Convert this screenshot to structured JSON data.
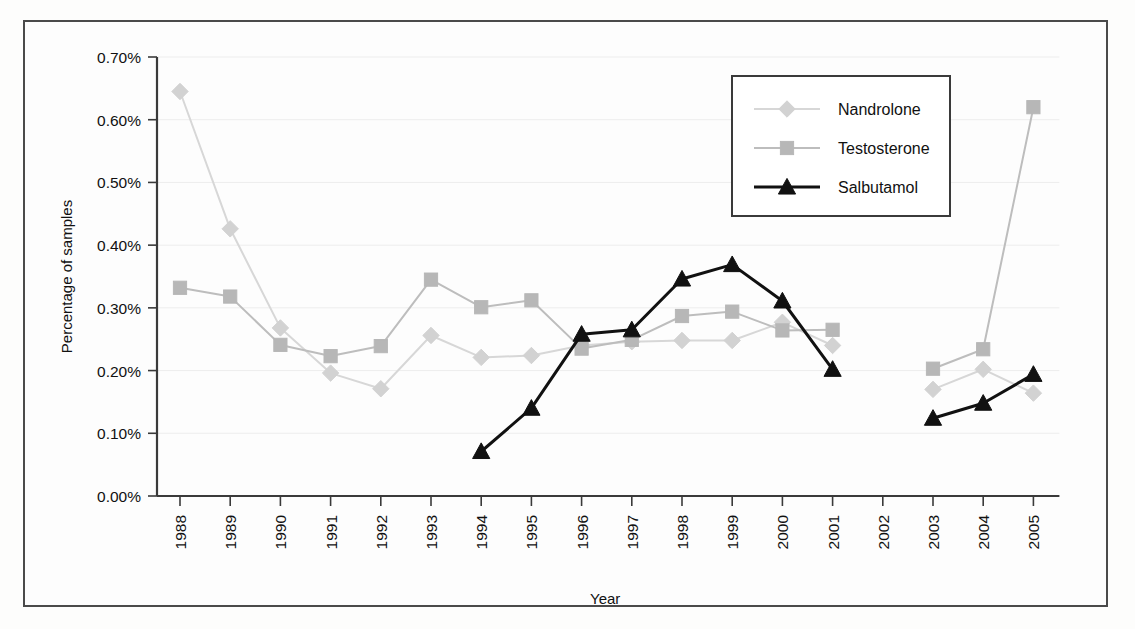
{
  "chart_data": {
    "type": "line",
    "title": "",
    "xlabel": "Year",
    "ylabel": "Percentage of samples",
    "x": [
      1988,
      1989,
      1990,
      1991,
      1992,
      1993,
      1994,
      1995,
      1996,
      1997,
      1998,
      1999,
      2000,
      2001,
      2002,
      2003,
      2004,
      2005
    ],
    "xtick_labels": [
      "1988",
      "1989",
      "1990",
      "1991",
      "1992",
      "1993",
      "1994",
      "1995",
      "1996",
      "1997",
      "1998",
      "1999",
      "2000",
      "2001",
      "2002",
      "2003",
      "2004",
      "2005"
    ],
    "ytick_labels": [
      "0.00%",
      "0.10%",
      "0.20%",
      "0.30%",
      "0.40%",
      "0.50%",
      "0.60%",
      "0.70%"
    ],
    "ytick_values": [
      0.0,
      0.1,
      0.2,
      0.3,
      0.4,
      0.5,
      0.6,
      0.7
    ],
    "ylim": [
      0.0,
      0.7
    ],
    "y_unit": "%",
    "grid": true,
    "legend_position": "top-right",
    "series": [
      {
        "name": "Nandrolone",
        "marker": "diamond",
        "color": "#d2d2d2",
        "line_color": "#d7d7d7",
        "values": [
          0.645,
          0.426,
          0.268,
          0.196,
          0.171,
          0.256,
          0.221,
          0.224,
          0.24,
          0.246,
          0.248,
          0.248,
          0.277,
          0.24,
          null,
          0.17,
          0.202,
          0.164
        ]
      },
      {
        "name": "Testosterone",
        "marker": "square",
        "color": "#b7b7b7",
        "line_color": "#bdbdbd",
        "values": [
          0.332,
          0.318,
          0.241,
          0.223,
          0.239,
          0.345,
          0.301,
          0.312,
          0.235,
          0.249,
          0.287,
          0.294,
          0.264,
          0.265,
          null,
          0.203,
          0.234,
          0.62
        ]
      },
      {
        "name": "Salbutamol",
        "marker": "triangle",
        "color": "#111111",
        "line_color": "#111111",
        "values": [
          null,
          null,
          null,
          null,
          null,
          null,
          0.071,
          0.14,
          0.258,
          0.265,
          0.346,
          0.369,
          0.311,
          0.202,
          null,
          0.124,
          0.148,
          0.194
        ]
      }
    ]
  },
  "legend": {
    "entries": [
      {
        "label": "Nandrolone"
      },
      {
        "label": "Testosterone"
      },
      {
        "label": "Salbutamol"
      }
    ]
  }
}
